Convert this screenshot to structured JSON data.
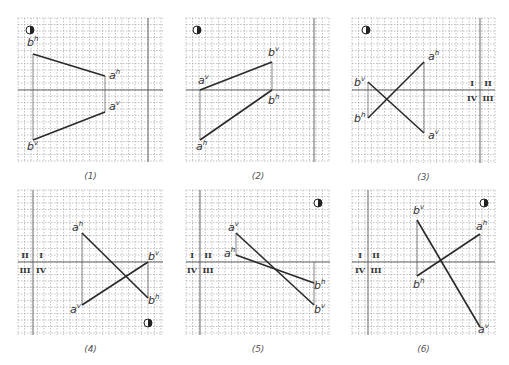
{
  "figure": {
    "panels": [
      {
        "caption": "(1)",
        "grid": {
          "x0": 18,
          "y0": 18,
          "x1": 163,
          "y1": 162
        },
        "axis_y": 90,
        "axis_x": 148,
        "eye_icon": {
          "x": 30,
          "y": 30
        },
        "segments": [
          {
            "name": "h-projection",
            "p1": {
              "label": "b",
              "sup": "h",
              "x": 33,
              "y": 54
            },
            "p2": {
              "label": "a",
              "sup": "h",
              "x": 105,
              "y": 76
            }
          },
          {
            "name": "v-projection",
            "p1": {
              "label": "b",
              "sup": "v",
              "x": 33,
              "y": 140
            },
            "p2": {
              "label": "a",
              "sup": "v",
              "x": 105,
              "y": 112
            }
          }
        ],
        "connectors": [
          {
            "x": 33,
            "y1": 54,
            "y2": 140
          },
          {
            "x": 105,
            "y1": 76,
            "y2": 112
          }
        ],
        "label_offsets": [
          [
            -6,
            -8
          ],
          [
            4,
            3
          ],
          [
            -6,
            10
          ],
          [
            4,
            -2
          ]
        ],
        "quadrants": null
      },
      {
        "caption": "(2)",
        "grid": {
          "x0": 186,
          "y0": 18,
          "x1": 330,
          "y1": 162
        },
        "axis_y": 90,
        "axis_x": 314,
        "eye_icon": {
          "x": 197,
          "y": 30
        },
        "segments": [
          {
            "name": "v-projection",
            "p1": {
              "label": "a",
              "sup": "v",
              "x": 200,
              "y": 90
            },
            "p2": {
              "label": "b",
              "sup": "v",
              "x": 272,
              "y": 62
            }
          },
          {
            "name": "h-projection",
            "p1": {
              "label": "a",
              "sup": "h",
              "x": 200,
              "y": 140
            },
            "p2": {
              "label": "b",
              "sup": "h",
              "x": 272,
              "y": 90
            }
          }
        ],
        "connectors": [
          {
            "x": 200,
            "y1": 90,
            "y2": 140
          },
          {
            "x": 272,
            "y1": 62,
            "y2": 90
          }
        ],
        "label_offsets": [
          [
            -2,
            -6
          ],
          [
            -4,
            -6
          ],
          [
            -4,
            10
          ],
          [
            -4,
            14
          ]
        ],
        "quadrants": null
      },
      {
        "caption": "(3)",
        "grid": {
          "x0": 352,
          "y0": 18,
          "x1": 495,
          "y1": 163
        },
        "axis_y": 90,
        "axis_x": 480,
        "eye_icon": {
          "x": 366,
          "y": 30
        },
        "segments": [
          {
            "name": "h-projection",
            "p1": {
              "label": "a",
              "sup": "h",
              "x": 424,
              "y": 62
            },
            "p2": {
              "label": "b",
              "sup": "h",
              "x": 368,
              "y": 118
            }
          },
          {
            "name": "v-projection",
            "p1": {
              "label": "b",
              "sup": "v",
              "x": 368,
              "y": 82
            },
            "p2": {
              "label": "a",
              "sup": "v",
              "x": 424,
              "y": 133
            }
          }
        ],
        "connectors": [
          {
            "x": 368,
            "y1": 82,
            "y2": 118
          },
          {
            "x": 424,
            "y1": 62,
            "y2": 133
          }
        ],
        "label_offsets": [
          [
            4,
            -2
          ],
          [
            -14,
            4
          ],
          [
            -14,
            4
          ],
          [
            4,
            6
          ]
        ],
        "quadrants": {
          "top_left": "I",
          "top_right": "II",
          "bottom_left": "IV",
          "bottom_right": "III",
          "cx": 480,
          "cy": 90
        }
      },
      {
        "caption": "(4)",
        "grid": {
          "x0": 18,
          "y0": 190,
          "x1": 163,
          "y1": 335
        },
        "axis_y": 262,
        "axis_x": 33,
        "eye_icon": {
          "x": 148,
          "y": 323
        },
        "segments": [
          {
            "name": "h-projection",
            "p1": {
              "label": "a",
              "sup": "h",
              "x": 82,
              "y": 233
            },
            "p2": {
              "label": "b",
              "sup": "h",
              "x": 148,
              "y": 298
            }
          },
          {
            "name": "v-projection",
            "p1": {
              "label": "b",
              "sup": "v",
              "x": 148,
              "y": 262
            },
            "p2": {
              "label": "a",
              "sup": "v",
              "x": 82,
              "y": 305
            }
          }
        ],
        "connectors": [
          {
            "x": 82,
            "y1": 233,
            "y2": 305
          },
          {
            "x": 148,
            "y1": 262,
            "y2": 298
          }
        ],
        "label_offsets": [
          [
            -10,
            -2
          ],
          [
            0,
            6
          ],
          [
            0,
            -2
          ],
          [
            -12,
            8
          ]
        ],
        "quadrants": {
          "top_left": "II",
          "top_right": "I",
          "bottom_left": "III",
          "bottom_right": "IV",
          "cx": 33,
          "cy": 262
        }
      },
      {
        "caption": "(5)",
        "grid": {
          "x0": 186,
          "y0": 190,
          "x1": 330,
          "y1": 335
        },
        "axis_y": 262,
        "axis_x": 200,
        "eye_icon": {
          "x": 318,
          "y": 203
        },
        "segments": [
          {
            "name": "v-projection",
            "p1": {
              "label": "a",
              "sup": "v",
              "x": 236,
              "y": 233
            },
            "p2": {
              "label": "b",
              "sup": "v",
              "x": 314,
              "y": 305
            }
          },
          {
            "name": "h-projection",
            "p1": {
              "label": "a",
              "sup": "h",
              "x": 236,
              "y": 255
            },
            "p2": {
              "label": "b",
              "sup": "h",
              "x": 314,
              "y": 283
            }
          }
        ],
        "connectors": [
          {
            "x": 236,
            "y1": 233,
            "y2": 255
          },
          {
            "x": 314,
            "y1": 262,
            "y2": 305
          }
        ],
        "label_offsets": [
          [
            -8,
            -2
          ],
          [
            0,
            8
          ],
          [
            -12,
            2
          ],
          [
            0,
            6
          ]
        ],
        "quadrants": {
          "top_left": "I",
          "top_right": "II",
          "bottom_left": "IV",
          "bottom_right": "III",
          "cx": 200,
          "cy": 262
        }
      },
      {
        "caption": "(6)",
        "grid": {
          "x0": 352,
          "y0": 190,
          "x1": 495,
          "y1": 335
        },
        "axis_y": 262,
        "axis_x": 368,
        "eye_icon": {
          "x": 484,
          "y": 203
        },
        "segments": [
          {
            "name": "v-projection",
            "p1": {
              "label": "b",
              "sup": "v",
              "x": 417,
              "y": 220
            },
            "p2": {
              "label": "a",
              "sup": "v",
              "x": 480,
              "y": 327
            }
          },
          {
            "name": "h-projection",
            "p1": {
              "label": "a",
              "sup": "h",
              "x": 480,
              "y": 234
            },
            "p2": {
              "label": "b",
              "sup": "h",
              "x": 417,
              "y": 276
            }
          }
        ],
        "connectors": [
          {
            "x": 417,
            "y1": 220,
            "y2": 276
          },
          {
            "x": 480,
            "y1": 234,
            "y2": 327
          }
        ],
        "label_offsets": [
          [
            -4,
            -6
          ],
          [
            -2,
            6
          ],
          [
            -4,
            -4
          ],
          [
            -4,
            12
          ]
        ],
        "quadrants": {
          "top_left": "I",
          "top_right": "II",
          "bottom_left": "IV",
          "bottom_right": "III",
          "cx": 368,
          "cy": 262
        }
      }
    ],
    "grid_step": 6.5,
    "colors": {
      "grid": "#9a9a9a",
      "axis": "#555555",
      "line": "#2a2a2a",
      "text": "#333333"
    }
  }
}
